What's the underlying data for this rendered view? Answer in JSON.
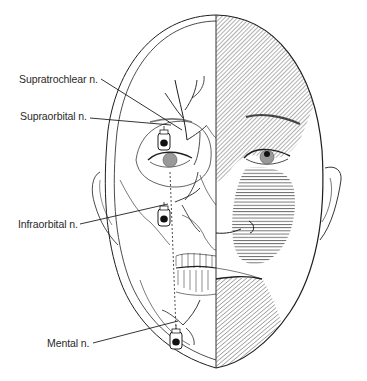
{
  "figure": {
    "labels": [
      {
        "id": "supratrochlear",
        "text": "Supratrochlear n."
      },
      {
        "id": "supraorbital",
        "text": "Supraorbital n."
      },
      {
        "id": "infraorbital",
        "text": "Infraorbital n."
      },
      {
        "id": "mental",
        "text": "Mental n."
      }
    ],
    "regions": {
      "left_half": "skull and nerve anatomy with syringe injection markers",
      "right_half": "skin surface with shaded sensory distributions",
      "shading": [
        {
          "name": "forehead-supraorbital-zone",
          "pattern": "diagonal-hatch"
        },
        {
          "name": "cheek-infraorbital-zone",
          "pattern": "horizontal-hatch"
        },
        {
          "name": "chin-mental-zone",
          "pattern": "diagonal-hatch"
        }
      ]
    },
    "colors": {
      "line": "#1e1e1e",
      "hatch": "#3a3a3a",
      "background": "#ffffff"
    }
  }
}
